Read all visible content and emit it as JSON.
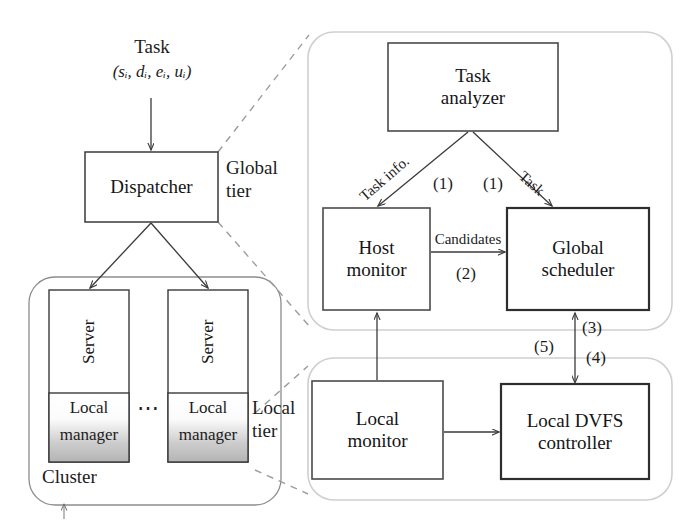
{
  "figure": {
    "tiers": {
      "global_label_line1": "Global",
      "global_label_line2": "tier",
      "local_label_line1": "Local",
      "local_label_line2": "tier"
    }
  },
  "input": {
    "task_label": "Task",
    "task_params": "(sᵢ, dᵢ, eᵢ, uᵢ)"
  },
  "boxes": {
    "dispatcher": {
      "line1": "Dispatcher",
      "line2": ""
    },
    "task_analyzer": {
      "line1": "Task",
      "line2": "analyzer"
    },
    "host_monitor": {
      "line1": "Host",
      "line2": "monitor"
    },
    "global_scheduler": {
      "line1": "Global",
      "line2": "scheduler"
    },
    "local_monitor": {
      "line1": "Local",
      "line2": "monitor"
    },
    "local_dvfs_controller": {
      "line1": "Local DVFS",
      "line2": "controller"
    },
    "server_1": {
      "title": "Server",
      "sub_line1": "Local",
      "sub_line2": "manager"
    },
    "server_2": {
      "title": "Server",
      "sub_line1": "Local",
      "sub_line2": "manager"
    },
    "cluster": {
      "label": "Cluster"
    },
    "ellipsis": "⋯"
  },
  "edges": {
    "task_info": {
      "label": "Task info.",
      "step": "(1)"
    },
    "task": {
      "label": "Task",
      "step": "(1)"
    },
    "candidates": {
      "label": "Candidates",
      "step": "(2)"
    },
    "scheduler_up": {
      "step": "(3)"
    },
    "dvfs_down": {
      "step": "(4)"
    },
    "monitor_up": {
      "step": "(5)"
    }
  },
  "colors": {
    "stroke": "#3a3a3a",
    "tier_stroke": "#c9c9c9",
    "dashed_stroke": "#9a9a9a",
    "manager_gradient_top": "#ffffff",
    "manager_gradient_bottom": "#b8b8b8",
    "text": "#1a1a1a",
    "background": "#ffffff"
  }
}
